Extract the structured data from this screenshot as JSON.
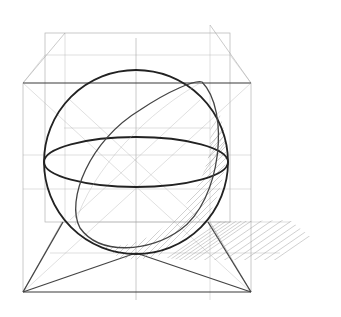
{
  "image": {
    "description": "Pencil construction sketch of a sphere inscribed in a cube, shown in perspective with a cast shadow",
    "subject": "sphere in cube",
    "medium": "pencil sketch",
    "colors": {
      "background": "#ffffff",
      "stroke_dark": "#222222",
      "stroke_light": "#9a9a9a"
    }
  }
}
